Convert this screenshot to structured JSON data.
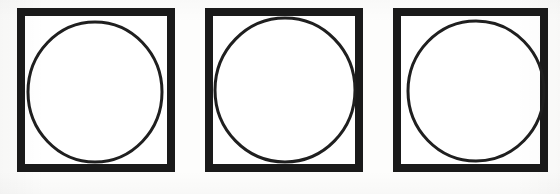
{
  "figure": {
    "background_color": "#fdfdfc",
    "ink_color": "#1a1a1a",
    "canvas": {
      "width": 560,
      "height": 194
    },
    "shape_count": 3
  },
  "shapes": [
    {
      "index": 1,
      "name": "circle-in-square-1",
      "label": "Square 1 with inscribed circle",
      "square": {
        "x": 17,
        "y": 8,
        "width": 158,
        "height": 164,
        "border_width": 8,
        "stroke_color": "#1a1a1a",
        "fill_color": "#ffffff"
      },
      "circle": {
        "center_x": 95,
        "center_y": 92,
        "radius_x": 67,
        "radius_y": 70,
        "stroke_width": 3,
        "stroke_color": "#1f1f1f",
        "fill_color": "none",
        "note": "touches left, top and bottom inner edges; small gap at right"
      }
    },
    {
      "index": 2,
      "name": "circle-in-square-2",
      "label": "Square 2 with inscribed circle",
      "square": {
        "x": 205,
        "y": 8,
        "width": 158,
        "height": 164,
        "border_width": 8,
        "stroke_color": "#1a1a1a",
        "fill_color": "#ffffff"
      },
      "circle": {
        "center_x": 285,
        "center_y": 90,
        "radius_x": 70,
        "radius_y": 72,
        "stroke_width": 3,
        "stroke_color": "#1f1f1f",
        "fill_color": "none",
        "note": "larger circle, meets the top border and right border"
      }
    },
    {
      "index": 3,
      "name": "circle-in-square-3",
      "label": "Square 3 with inscribed circle",
      "square": {
        "x": 393,
        "y": 8,
        "width": 155,
        "height": 164,
        "border_width": 8,
        "stroke_color": "#1a1a1a",
        "fill_color": "#ffffff"
      },
      "circle": {
        "center_x": 476,
        "center_y": 91,
        "radius_x": 68,
        "radius_y": 70,
        "stroke_width": 3,
        "stroke_color": "#1f1f1f",
        "fill_color": "none",
        "note": "shifted slightly right, touching the right inner border"
      }
    }
  ]
}
